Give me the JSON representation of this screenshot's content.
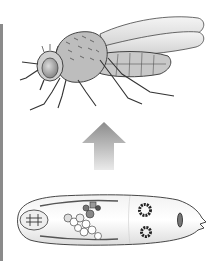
{
  "diagram": {
    "type": "life-cycle-illustration",
    "stages": [
      {
        "name": "adult-fly",
        "position": "top"
      },
      {
        "name": "larva",
        "position": "bottom"
      }
    ],
    "arrow": {
      "direction": "up",
      "from": "larva",
      "to": "adult-fly"
    },
    "colors": {
      "background": "#ffffff",
      "arrow_top": "#8c8c8c",
      "arrow_bottom": "#e6e6e6",
      "outline": "#333333",
      "body_fill": "#d9d9d9",
      "edge_line": "#8a8a8a"
    }
  }
}
